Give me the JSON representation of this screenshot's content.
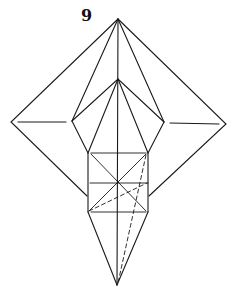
{
  "diagram": {
    "step_number": "9",
    "line_color": "#1a1a1a",
    "background": "#ffffff",
    "points": {
      "top_apex": [
        118,
        19
      ],
      "outer_left": [
        11,
        122
      ],
      "outer_right": [
        226,
        124
      ],
      "inner_apex": [
        118,
        79
      ],
      "pentagon_left": [
        72,
        121
      ],
      "pentagon_right": [
        164,
        122
      ],
      "box_top_left": [
        88,
        153
      ],
      "box_top_right": [
        148,
        153
      ],
      "box_mid_left": [
        88,
        183
      ],
      "box_mid_right": [
        148,
        183
      ],
      "box_bottom_left": [
        88,
        212
      ],
      "box_bottom_right": [
        148,
        212
      ],
      "bottom_point": [
        117,
        285
      ]
    }
  }
}
